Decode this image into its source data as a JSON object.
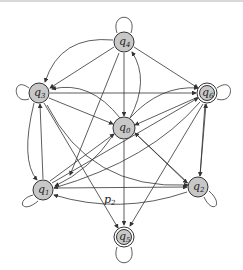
{
  "diagram": {
    "type": "state-transition-graph",
    "nodes": [
      {
        "id": "q0",
        "label": "q",
        "sub": "0",
        "x": 124,
        "y": 128,
        "accepting": false,
        "self_loop": false
      },
      {
        "id": "q1",
        "label": "q",
        "sub": "1",
        "x": 43,
        "y": 190,
        "accepting": false,
        "self_loop": true
      },
      {
        "id": "q2",
        "label": "q",
        "sub": "2",
        "x": 198,
        "y": 187,
        "accepting": false,
        "self_loop": true
      },
      {
        "id": "q3",
        "label": "q",
        "sub": "3",
        "x": 39,
        "y": 93,
        "accepting": false,
        "self_loop": true
      },
      {
        "id": "q4",
        "label": "q",
        "sub": "4",
        "x": 124,
        "y": 42,
        "accepting": false,
        "self_loop": true
      },
      {
        "id": "q5",
        "label": "q",
        "sub": "5",
        "x": 124,
        "y": 237,
        "accepting": true,
        "self_loop": true
      },
      {
        "id": "q6",
        "label": "q",
        "sub": "6",
        "x": 207,
        "y": 93,
        "accepting": true,
        "self_loop": true
      }
    ],
    "edge_label": {
      "text": "p",
      "sub": "2",
      "x": 107,
      "y": 200
    },
    "colors": {
      "node_fill": "#c8c8c8",
      "stroke": "#333333"
    }
  }
}
